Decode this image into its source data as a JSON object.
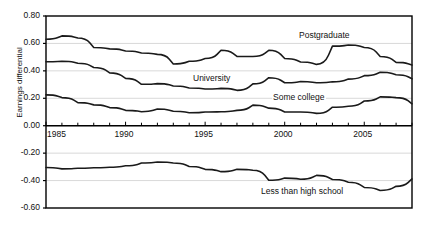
{
  "chart_data": {
    "type": "line",
    "title": "",
    "xlabel": "",
    "ylabel": "Earnings differential",
    "xlim": [
      1985,
      2008
    ],
    "ylim": [
      -0.6,
      0.8
    ],
    "ytick_step": 0.2,
    "grid": true,
    "legend": "inline-labels",
    "yticks": [
      "0.80",
      "0.60",
      "0.40",
      "0.20",
      "0.00",
      "-0.20",
      "-0.40",
      "-0.60"
    ],
    "ytick_values": [
      0.8,
      0.6,
      0.4,
      0.2,
      0.0,
      -0.2,
      -0.4,
      -0.6
    ],
    "xticks": [
      "1985",
      "1990",
      "1995",
      "2000",
      "2005"
    ],
    "xtick_values": [
      1985,
      1990,
      1995,
      2000,
      2005
    ],
    "x": [
      1985,
      1986,
      1987,
      1988,
      1989,
      1990,
      1991,
      1992,
      1993,
      1994,
      1995,
      1996,
      1997,
      1998,
      1999,
      2000,
      2001,
      2002,
      2003,
      2004,
      2005,
      2006,
      2007,
      2008
    ],
    "series": [
      {
        "name": "Postgraduate",
        "label": "Postgraduate",
        "color": "#1a1a1a",
        "values": [
          0.63,
          0.655,
          0.64,
          0.57,
          0.56,
          0.545,
          0.53,
          0.52,
          0.45,
          0.47,
          0.49,
          0.55,
          0.505,
          0.505,
          0.55,
          0.49,
          0.465,
          0.447,
          0.58,
          0.588,
          0.57,
          0.505,
          0.462,
          0.443
        ]
      },
      {
        "name": "University",
        "label": "University",
        "color": "#1a1a1a",
        "values": [
          0.466,
          0.47,
          0.455,
          0.425,
          0.385,
          0.345,
          0.302,
          0.307,
          0.29,
          0.275,
          0.268,
          0.272,
          0.258,
          0.305,
          0.35,
          0.313,
          0.322,
          0.313,
          0.32,
          0.34,
          0.365,
          0.39,
          0.372,
          0.342
        ]
      },
      {
        "name": "Some college",
        "label": "Some college",
        "color": "#1a1a1a",
        "values": [
          0.225,
          0.205,
          0.168,
          0.152,
          0.132,
          0.112,
          0.102,
          0.122,
          0.105,
          0.095,
          0.1,
          0.102,
          0.112,
          0.15,
          0.128,
          0.1,
          0.1,
          0.09,
          0.135,
          0.142,
          0.18,
          0.21,
          0.205,
          0.16
        ]
      },
      {
        "name": "Less than high school",
        "label": "Less than high school",
        "color": "#1a1a1a",
        "values": [
          -0.305,
          -0.315,
          -0.31,
          -0.307,
          -0.303,
          -0.292,
          -0.272,
          -0.265,
          -0.272,
          -0.297,
          -0.318,
          -0.335,
          -0.318,
          -0.325,
          -0.398,
          -0.382,
          -0.39,
          -0.362,
          -0.392,
          -0.412,
          -0.45,
          -0.472,
          -0.442,
          -0.388
        ]
      }
    ],
    "series_label_positions": [
      {
        "name": "Postgraduate",
        "x_px": 298,
        "y_px": 30
      },
      {
        "name": "University",
        "x_px": 192,
        "y_px": 73
      },
      {
        "name": "Some college",
        "x_px": 272,
        "y_px": 92
      },
      {
        "name": "Less than high school",
        "x_px": 260,
        "y_px": 186
      }
    ],
    "style": {
      "axis_color": "#000000",
      "grid_color": "#d9d9d9",
      "background": "#ffffff",
      "line_width_px": 1.6
    }
  }
}
